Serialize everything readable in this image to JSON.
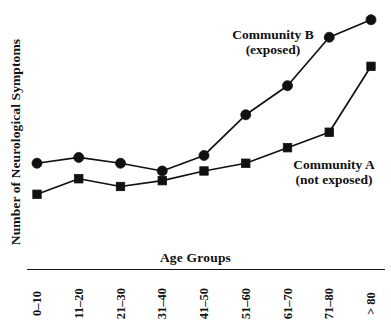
{
  "chart_data": {
    "type": "line",
    "title": "",
    "xlabel": "Age Groups",
    "ylabel": "Number of Neurological Symptoms",
    "categories": [
      "0–10",
      "11–20",
      "21–30",
      "31–40",
      "41–50",
      "51–60",
      "61–70",
      "71–80",
      "> 80"
    ],
    "grid": false,
    "legend_position": "inline-annotation",
    "y_axis_ticks_shown": false,
    "x_axis_ticks_shown": false,
    "series": [
      {
        "name": "Community B",
        "qualifier": "(exposed)",
        "marker": "circle",
        "color": "#111111",
        "values": [
          2.6,
          2.9,
          2.6,
          2.2,
          3.0,
          5.1,
          6.6,
          9.1,
          10.0
        ]
      },
      {
        "name": "Community A",
        "qualifier": "(not exposed)",
        "marker": "square",
        "color": "#111111",
        "values": [
          1.0,
          1.8,
          1.4,
          1.7,
          2.2,
          2.6,
          3.4,
          4.2,
          7.6
        ]
      }
    ],
    "annotations": [
      {
        "text": "Community B",
        "subtext": "(exposed)",
        "series": "Community B"
      },
      {
        "text": "Community A",
        "subtext": "(not exposed)",
        "series": "Community A"
      }
    ]
  },
  "axes": {
    "x_title": "Age Groups",
    "y_title": "Number of Neurological Symptoms"
  },
  "labels": {
    "community_b": {
      "name": "Community B",
      "qualifier": "(exposed)"
    },
    "community_a": {
      "name": "Community A",
      "qualifier": "(not exposed)"
    }
  },
  "colors": {
    "ink": "#111111",
    "background": "#ffffff"
  }
}
